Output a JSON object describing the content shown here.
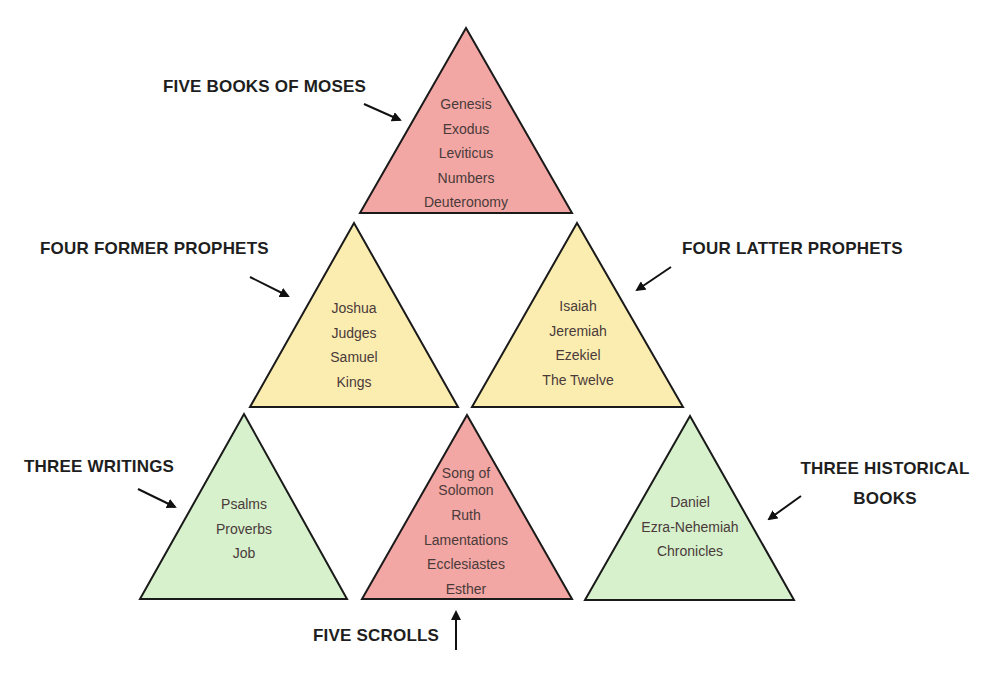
{
  "colors": {
    "red_fill": "#f3a7a4",
    "yellow_fill": "#fbedb0",
    "green_fill": "#d6f1cc",
    "outline": "#1a1a1a",
    "text": "#4a3a3a",
    "label_text": "#1e1e1e"
  },
  "triangles": [
    {
      "id": "moses",
      "group": "FIVE BOOKS OF MOSES",
      "color": "red",
      "books": [
        "Genesis",
        "Exodus",
        "Leviticus",
        "Numbers",
        "Deuteronomy"
      ]
    },
    {
      "id": "former",
      "group": "FOUR FORMER PROPHETS",
      "color": "yellow",
      "books": [
        "Joshua",
        "Judges",
        "Samuel",
        "Kings"
      ]
    },
    {
      "id": "latter",
      "group": "FOUR LATTER PROPHETS",
      "color": "yellow",
      "books": [
        "Isaiah",
        "Jeremiah",
        "Ezekiel",
        "The Twelve"
      ]
    },
    {
      "id": "writings",
      "group": "THREE WRITINGS",
      "color": "green",
      "books": [
        "Psalms",
        "Proverbs",
        "Job"
      ]
    },
    {
      "id": "scrolls",
      "group": "FIVE SCROLLS",
      "color": "red",
      "books": [
        "Song of",
        "Solomon",
        "Ruth",
        "Lamentations",
        "Ecclesiastes",
        "Esther"
      ]
    },
    {
      "id": "historical",
      "group": "THREE HISTORICAL BOOKS",
      "color": "green",
      "books": [
        "Daniel",
        "Ezra-Nehemiah",
        "Chronicles"
      ]
    }
  ],
  "labels": {
    "moses": "FIVE BOOKS OF MOSES",
    "former": "FOUR FORMER PROPHETS",
    "latter": "FOUR LATTER PROPHETS",
    "writings": "THREE WRITINGS",
    "historical_line1": "THREE HISTORICAL",
    "historical_line2": "BOOKS",
    "scrolls": "FIVE SCROLLS"
  }
}
